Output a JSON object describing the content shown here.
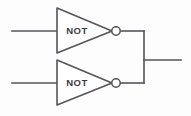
{
  "diagram": {
    "type": "logic-circuit",
    "background_color": "#fdfdfd",
    "line_color": "#55555a",
    "fill_color": "#ffffff",
    "gates": [
      {
        "id": "gate-top",
        "label": "NOT",
        "kind": "inverter",
        "label_x": 77,
        "label_y": 31,
        "body_path": "M 57 8 L 112 31 L 57 53 Z",
        "bubble_cx": 116,
        "bubble_cy": 31,
        "bubble_r": 4.2
      },
      {
        "id": "gate-bottom",
        "label": "NOT",
        "kind": "inverter",
        "label_x": 77,
        "label_y": 83,
        "body_path": "M 57 60 L 112 83 L 57 105 Z",
        "bubble_cx": 116,
        "bubble_cy": 83,
        "bubble_r": 4.2
      }
    ],
    "wires": [
      {
        "id": "wire-input-top",
        "role": "input",
        "path": "M 12 31 L 56 31"
      },
      {
        "id": "wire-input-bottom",
        "role": "input",
        "path": "M 12 83 L 56 83"
      },
      {
        "id": "wire-top-to-bus",
        "role": "interconnect",
        "path": "M 120 31 L 144 31"
      },
      {
        "id": "wire-bottom-to-bus",
        "role": "interconnect",
        "path": "M 120 83 L 144 83"
      },
      {
        "id": "wire-vertical-bus",
        "role": "bus",
        "path": "M 144 31 L 144 83"
      },
      {
        "id": "wire-output",
        "role": "output",
        "path": "M 144 60 L 181 60"
      }
    ]
  }
}
